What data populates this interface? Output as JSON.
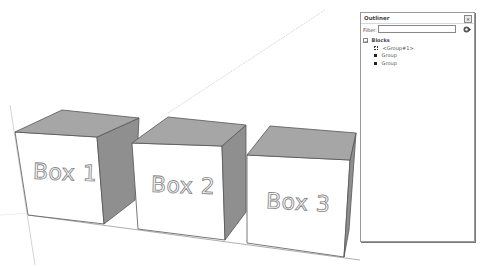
{
  "viewport": {
    "colors": {
      "background": "#ffffff",
      "top_face": "#a6a6a6",
      "side_face": "#8f8f8f",
      "front_face": "#ffffff",
      "edge": "#555555",
      "axis": "#c8c8c8",
      "label_outline": "#8a8a8a"
    },
    "boxes": [
      {
        "name": "box-1",
        "label": "Box 1"
      },
      {
        "name": "box-2",
        "label": "Box 2"
      },
      {
        "name": "box-3",
        "label": "Box 3"
      }
    ]
  },
  "outliner": {
    "title": "Outliner",
    "close_icon": "×",
    "filter_label": "Filter:",
    "filter_value": "",
    "filter_placeholder": "",
    "filter_icon": "filter-options-icon",
    "tree": {
      "root": {
        "label": "Blocks",
        "expander": "−"
      },
      "children": [
        {
          "label": "<Group#1>",
          "icon": "group-dotted-icon"
        },
        {
          "label": "Group",
          "icon": "group-icon"
        },
        {
          "label": "Group",
          "icon": "group-icon"
        }
      ]
    }
  }
}
